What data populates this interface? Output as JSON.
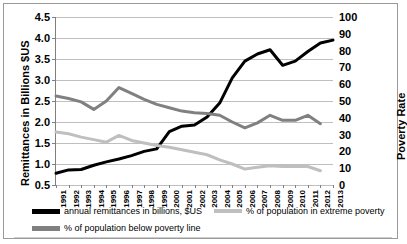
{
  "chart_data": {
    "type": "line",
    "title": "",
    "xlabel": "",
    "ylabel": "Remittances in Billions $US",
    "y2label": "Poverty Rate",
    "ylim": [
      0.5,
      4.5
    ],
    "y2lim": [
      0,
      100
    ],
    "ytick_labels": [
      "4.5",
      "4.0",
      "3.5",
      "3.0",
      "2.5",
      "2.0",
      "1.5",
      "1.0",
      "0.5"
    ],
    "ytick_values": [
      4.5,
      4.0,
      3.5,
      3.0,
      2.5,
      2.0,
      1.5,
      1.0,
      0.5
    ],
    "y2tick_labels": [
      "100",
      "90",
      "80",
      "70",
      "60",
      "50",
      "40",
      "30",
      "20",
      "10",
      "0"
    ],
    "y2tick_values": [
      100,
      90,
      80,
      70,
      60,
      50,
      40,
      30,
      20,
      10,
      0
    ],
    "grid": true,
    "legend_position": "bottom",
    "categories": [
      "1991",
      "1992",
      "1993",
      "1994",
      "1995",
      "1996",
      "1997",
      "1998",
      "1999",
      "2000",
      "2001",
      "2002",
      "2003",
      "2004",
      "2005",
      "2006",
      "2007",
      "2008",
      "2009",
      "2010",
      "2011",
      "2012",
      "2013"
    ],
    "series": [
      {
        "name": "annual remittances in billions, $US",
        "axis": "left",
        "color": "#000000",
        "width": 3,
        "values": [
          0.78,
          0.86,
          0.87,
          0.97,
          1.05,
          1.12,
          1.2,
          1.3,
          1.36,
          1.77,
          1.9,
          1.93,
          2.12,
          2.45,
          3.05,
          3.45,
          3.62,
          3.72,
          3.35,
          3.45,
          3.68,
          3.88,
          3.95
        ]
      },
      {
        "name": "% of population below poverty line",
        "axis": "right",
        "color": "#808080",
        "width": 3,
        "values": [
          53.0,
          51.5,
          49.5,
          45.0,
          50.0,
          58.0,
          54.5,
          51.0,
          48.0,
          46.0,
          44.0,
          43.0,
          42.5,
          41.5,
          37.5,
          34.0,
          37.0,
          41.5,
          38.5,
          38.5,
          41.5,
          36.5,
          null
        ]
      },
      {
        "name": "% of population in extreme poverty",
        "axis": "right",
        "color": "#bfbfbf",
        "width": 3,
        "values": [
          31.5,
          30.5,
          28.5,
          27.0,
          25.5,
          29.5,
          26.5,
          25.0,
          23.5,
          22.5,
          21.0,
          19.5,
          18.0,
          15.0,
          12.5,
          9.5,
          10.5,
          11.5,
          11.0,
          11.0,
          11.0,
          8.5,
          null
        ]
      }
    ]
  },
  "axis_titles": {
    "left": "Remittances in Billions $US",
    "right": "Poverty Rate"
  },
  "legend": {
    "items": [
      {
        "label": "annual remittances in billions, $US",
        "color": "#000000"
      },
      {
        "label": "% of population in extreme poverty",
        "color": "#bfbfbf"
      },
      {
        "label": "% of population below poverty line",
        "color": "#808080"
      }
    ]
  }
}
